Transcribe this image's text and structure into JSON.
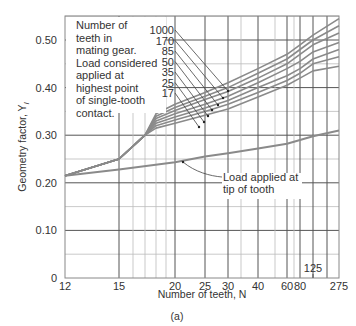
{
  "chart_data": {
    "type": "line",
    "title": "",
    "caption": "(a)",
    "xlabel": "Number of teeth, N",
    "ylabel": "Geometry factor, Y",
    "ylabel_subscript": "I",
    "xscale": "nonlinear (inverse-tooth-count style)",
    "x_ticks": [
      12,
      15,
      20,
      25,
      30,
      40,
      60,
      80,
      275
    ],
    "x_tick_labels": [
      "12",
      "15",
      "20",
      "25",
      "30",
      "40",
      "60",
      "80",
      "275"
    ],
    "x_extra_annotation": "125",
    "y_ticks": [
      0,
      0.1,
      0.2,
      0.3,
      0.4,
      0.5
    ],
    "y_tick_labels": [
      "0",
      "0.10",
      "0.20",
      "0.30",
      "0.40",
      "0.50"
    ],
    "ylim": [
      0,
      0.55
    ],
    "xlim": [
      12,
      275
    ],
    "grid": true,
    "annotation_highest_point": "Number of teeth in mating gear. Load considered applied at highest point of single-tooth contact.",
    "annotation_tip": "Load applied at tip of tooth",
    "series_label_order": [
      "1000",
      "170",
      "85",
      "50",
      "35",
      "25",
      "17"
    ],
    "series": [
      {
        "name": "Load applied at tip of tooth",
        "x": [
          12,
          15,
          20,
          25,
          30,
          40,
          60,
          80,
          125,
          275
        ],
        "values": [
          0.215,
          0.228,
          0.243,
          0.255,
          0.262,
          0.272,
          0.282,
          0.29,
          0.298,
          0.31
        ]
      },
      {
        "name": "Mating gear 1000 teeth",
        "x": [
          12,
          15,
          17,
          18,
          20,
          25,
          30,
          40,
          60,
          80,
          125,
          275
        ],
        "values": [
          0.215,
          0.25,
          0.3,
          0.345,
          0.365,
          0.39,
          0.41,
          0.44,
          0.47,
          0.49,
          0.51,
          0.545
        ]
      },
      {
        "name": "Mating gear 170 teeth",
        "x": [
          12,
          15,
          17,
          18,
          20,
          25,
          30,
          40,
          60,
          80,
          125,
          275
        ],
        "values": [
          0.215,
          0.25,
          0.3,
          0.34,
          0.358,
          0.382,
          0.4,
          0.43,
          0.46,
          0.48,
          0.5,
          0.53
        ]
      },
      {
        "name": "Mating gear 85 teeth",
        "x": [
          12,
          15,
          17,
          18,
          20,
          25,
          30,
          40,
          60,
          80,
          125,
          275
        ],
        "values": [
          0.215,
          0.25,
          0.3,
          0.335,
          0.352,
          0.375,
          0.392,
          0.42,
          0.45,
          0.47,
          0.49,
          0.515
        ]
      },
      {
        "name": "Mating gear 50 teeth",
        "x": [
          12,
          15,
          17,
          18,
          20,
          25,
          30,
          40,
          60,
          80,
          125,
          275
        ],
        "values": [
          0.215,
          0.25,
          0.3,
          0.33,
          0.345,
          0.365,
          0.382,
          0.41,
          0.44,
          0.455,
          0.475,
          0.495
        ]
      },
      {
        "name": "Mating gear 35 teeth",
        "x": [
          12,
          15,
          17,
          18,
          20,
          25,
          30,
          40,
          60,
          80,
          125,
          275
        ],
        "values": [
          0.215,
          0.25,
          0.3,
          0.325,
          0.338,
          0.357,
          0.373,
          0.4,
          0.425,
          0.44,
          0.46,
          0.48
        ]
      },
      {
        "name": "Mating gear 25 teeth",
        "x": [
          12,
          15,
          17,
          18,
          20,
          25,
          30,
          40,
          60,
          80,
          125,
          275
        ],
        "values": [
          0.215,
          0.25,
          0.3,
          0.32,
          0.332,
          0.35,
          0.365,
          0.39,
          0.415,
          0.43,
          0.45,
          0.465
        ]
      },
      {
        "name": "Mating gear 17 teeth",
        "x": [
          12,
          15,
          17,
          18,
          20,
          25,
          30,
          40,
          60,
          80,
          125,
          275
        ],
        "values": [
          0.215,
          0.25,
          0.3,
          0.315,
          0.325,
          0.342,
          0.355,
          0.38,
          0.405,
          0.42,
          0.435,
          0.445
        ]
      }
    ]
  },
  "text": {
    "note_lines": [
      "Number of",
      "teeth in",
      "mating gear.",
      "Load considered",
      "applied at",
      "highest point",
      "of single-tooth",
      "contact."
    ],
    "tip_lines": [
      "Load applied at",
      "tip of tooth"
    ],
    "xlabel": "Number of teeth, N",
    "ylabel": "Geometry factor, Y",
    "ylabel_sub": "I",
    "caption": "(a)",
    "annot125": "125"
  }
}
